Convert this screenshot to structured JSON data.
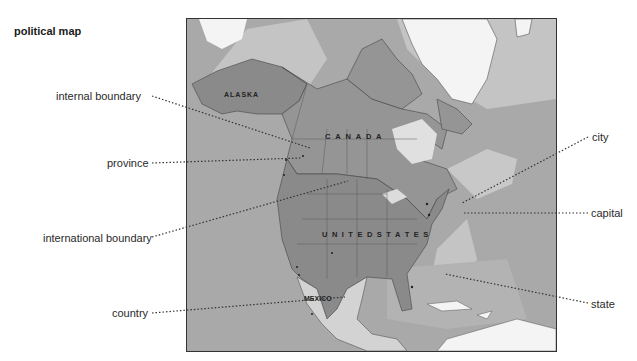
{
  "title": "political map",
  "labels": {
    "internal_boundary": "internal boundary",
    "province": "province",
    "international_boundary": "international boundary",
    "country": "country",
    "city": "city",
    "capital": "capital",
    "state": "state"
  },
  "map": {
    "regions": {
      "alaska": "ALASKA",
      "canada": "C A N A D A",
      "united_states": "U N I T E D   S T A T E S",
      "mexico": "MEXICO"
    },
    "cities": [
      "Edmonton",
      "Calgary",
      "Vancouver",
      "Seattle",
      "Winnipeg",
      "Montreal",
      "Ottawa",
      "Toronto",
      "Detroit",
      "Chicago",
      "New York",
      "Washington",
      "San Francisco",
      "Los Angeles",
      "San Diego",
      "Denver",
      "Dallas",
      "Houston",
      "Atlanta",
      "Miami",
      "Monterrey",
      "Guadalajara",
      "Mexico City"
    ]
  },
  "colors": {
    "ocean": "#a9a9a9",
    "shallow": "#c4c4c4",
    "land_us": "#8a8a8a",
    "land_canada": "#959595",
    "land_mexico": "#d3d3d3",
    "ice": "#f4f4f4",
    "leader": "#333333"
  }
}
